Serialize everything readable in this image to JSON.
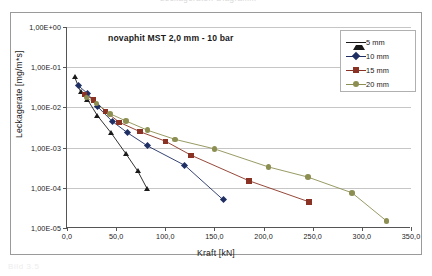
{
  "figure": {
    "top_clipped_text": "Leckageraten-Diagramm",
    "bottom_clipped_text": "Bild 3.5"
  },
  "chart_data": {
    "type": "line",
    "title": "novaphit MST 2,0 mm  -  10 bar",
    "xlabel": "Kraft  [kN]",
    "ylabel": "Leckagerate [mg/m*s]",
    "yscale": "log",
    "xlim": [
      0,
      350
    ],
    "ylim": [
      1e-05,
      1
    ],
    "grid": true,
    "legend_position": "top-right",
    "xticks": [
      "0,0",
      "50,0",
      "100,0",
      "150,0",
      "200,0",
      "250,0",
      "300,0",
      "350,0"
    ],
    "xtick_values": [
      0,
      50,
      100,
      150,
      200,
      250,
      300,
      350
    ],
    "yticks": [
      "1,00E+00",
      "1,00E-01",
      "1,00E-02",
      "1,00E-03",
      "1,00E-04",
      "1,00E-05"
    ],
    "ytick_values": [
      1,
      0.1,
      0.01,
      0.001,
      0.0001,
      1e-05
    ],
    "series": [
      {
        "name": "5 mm",
        "color": "#1a1a1a",
        "marker": "triangle",
        "points": [
          {
            "x": 8,
            "y": 0.055
          },
          {
            "x": 14,
            "y": 0.024
          },
          {
            "x": 21,
            "y": 0.0155
          },
          {
            "x": 31,
            "y": 0.0062
          },
          {
            "x": 45,
            "y": 0.0023
          },
          {
            "x": 60,
            "y": 0.0007
          },
          {
            "x": 72,
            "y": 0.00026
          },
          {
            "x": 82,
            "y": 9e-05
          }
        ]
      },
      {
        "name": "10 mm",
        "color": "#1f2f63",
        "marker": "diamond",
        "points": [
          {
            "x": 12,
            "y": 0.034
          },
          {
            "x": 21,
            "y": 0.022
          },
          {
            "x": 31,
            "y": 0.0105
          },
          {
            "x": 46,
            "y": 0.0045
          },
          {
            "x": 62,
            "y": 0.0023
          },
          {
            "x": 82,
            "y": 0.0011
          },
          {
            "x": 120,
            "y": 0.00036
          },
          {
            "x": 159,
            "y": 5e-05
          }
        ]
      },
      {
        "name": "15 mm",
        "color": "#8a3324",
        "marker": "square",
        "points": [
          {
            "x": 18,
            "y": 0.021
          },
          {
            "x": 27,
            "y": 0.0155
          },
          {
            "x": 39,
            "y": 0.008
          },
          {
            "x": 53,
            "y": 0.0043
          },
          {
            "x": 74,
            "y": 0.0025
          },
          {
            "x": 100,
            "y": 0.00145
          },
          {
            "x": 126,
            "y": 0.00065
          },
          {
            "x": 185,
            "y": 0.00015
          },
          {
            "x": 246,
            "y": 4.5e-05
          }
        ]
      },
      {
        "name": "20 mm",
        "color": "#8d8f52",
        "marker": "circle",
        "points": [
          {
            "x": 20,
            "y": 0.0175
          },
          {
            "x": 30,
            "y": 0.0125
          },
          {
            "x": 44,
            "y": 0.0069
          },
          {
            "x": 60,
            "y": 0.0046
          },
          {
            "x": 82,
            "y": 0.0027
          },
          {
            "x": 110,
            "y": 0.0016
          },
          {
            "x": 150,
            "y": 0.00093
          },
          {
            "x": 205,
            "y": 0.00033
          },
          {
            "x": 245,
            "y": 0.000185
          },
          {
            "x": 290,
            "y": 7.5e-05
          },
          {
            "x": 325,
            "y": 1.5e-05
          }
        ]
      }
    ]
  },
  "legend": {
    "items": [
      {
        "label": "5 mm"
      },
      {
        "label": "10 mm"
      },
      {
        "label": "15 mm"
      },
      {
        "label": "20 mm"
      }
    ]
  }
}
